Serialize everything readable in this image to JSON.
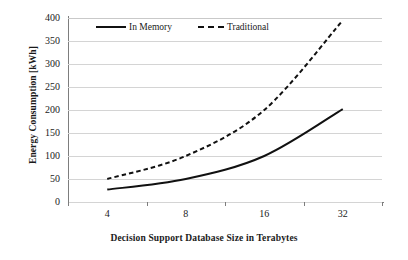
{
  "chart_data": {
    "type": "line",
    "title": "",
    "xlabel": "Decision Support Database Size in Terabytes",
    "ylabel": "Energy Consumption [kWh]",
    "categories": [
      "4",
      "8",
      "16",
      "32"
    ],
    "x": [
      4,
      8,
      16,
      32
    ],
    "series": [
      {
        "name": "In Memory",
        "style": "solid",
        "color": "#111111",
        "values": [
          27,
          50,
          100,
          202
        ]
      },
      {
        "name": "Traditional",
        "style": "dashed",
        "color": "#111111",
        "values": [
          50,
          100,
          200,
          395
        ]
      }
    ],
    "ylim": [
      0,
      400
    ],
    "ytick_step": 50,
    "yticks": [
      "0",
      "50",
      "100",
      "150",
      "200",
      "250",
      "300",
      "350",
      "400"
    ],
    "grid": "horizontal",
    "legend_position": "top-inside",
    "background_color": "#ffffff",
    "gridline_color": "#d4d4d4",
    "axis_color": "#7d7d7d"
  },
  "legend": {
    "entries": [
      {
        "label": "In Memory",
        "style": "solid"
      },
      {
        "label": "Traditional",
        "style": "dashed"
      }
    ]
  }
}
